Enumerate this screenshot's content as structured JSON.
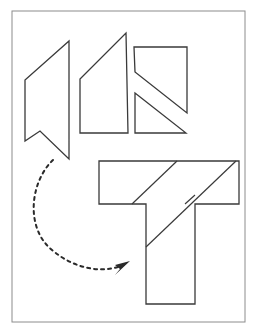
{
  "figure": {
    "caption": "",
    "background_color": "#ffffff",
    "frame": {
      "name": "figure-border",
      "x": 12,
      "y": 11,
      "width": 233,
      "height": 311,
      "stroke_color": "#8c8c8c",
      "stroke_width": 1,
      "fill_color": "#ffffff"
    },
    "style": {
      "piece_stroke_color": "#3a3a3a",
      "piece_stroke_width": 1.3,
      "piece_fill_color": "#ffffff",
      "cut_line_color": "#3a3a3a",
      "cut_line_width": 1.2,
      "arrow_color": "#2a2a2a",
      "arrow_stroke_width": 2,
      "arrow_dash_pattern": "3 4"
    },
    "pieces": [
      {
        "id": "piece-1",
        "label": "notched-quadrilateral",
        "points": "69,41 69,159 40,131 25,141 25,80",
        "description": "Tall slanted quadrilateral with a V notch cut into its lower left edge"
      },
      {
        "id": "piece-2",
        "label": "right-trapezoid",
        "points": "126,33 128,133 80,133 80,79",
        "description": "Trapezoid with vertical right edge and long slanted top edge"
      },
      {
        "id": "piece-3-upper",
        "label": "upper-right-polygon",
        "points": "134,47 187,47 187,113 135,72",
        "description": "Quadrilateral forming upper portion of the right rectangle, cut by a diagonal"
      },
      {
        "id": "piece-3-lower",
        "label": "lower-right-triangle",
        "points": "135,93 186,133 135,133",
        "description": "Right triangle forming lower-left portion of the right rectangle"
      },
      {
        "id": "piece-4-assembled-t",
        "label": "assembled-t-shape",
        "points": "99,161 239,161 239,204 195,204 195,304 146,304 146,204 99,204",
        "description": "The assembled T shaped figure made from the three pieces"
      }
    ],
    "cut_lines": [
      {
        "id": "cut-1",
        "label": "t-shape-left-diagonal",
        "x1": 132,
        "y1": 204,
        "x2": 177,
        "y2": 161
      },
      {
        "id": "cut-2",
        "label": "t-shape-right-diagonal",
        "x1": 146,
        "y1": 247,
        "x2": 236,
        "y2": 161
      },
      {
        "id": "cut-3",
        "label": "t-shape-stem-shoulder",
        "x1": 185,
        "y1": 204,
        "x2": 195,
        "y2": 195
      }
    ],
    "arrow": {
      "id": "transform-arrow",
      "label": "rearrangement-arrow",
      "style": "dashed-curved-arrow",
      "path": "M 53,160 C 30,182 25,228 52,250 C 78,272 108,273 125,264",
      "head_points": "130,261 115,265 120,269 115,275",
      "start_point": [
        53,
        160
      ],
      "end_point": [
        128,
        262
      ],
      "direction": "counter-clockwise sweep from upper-left pieces down and right to the assembled shape"
    }
  }
}
